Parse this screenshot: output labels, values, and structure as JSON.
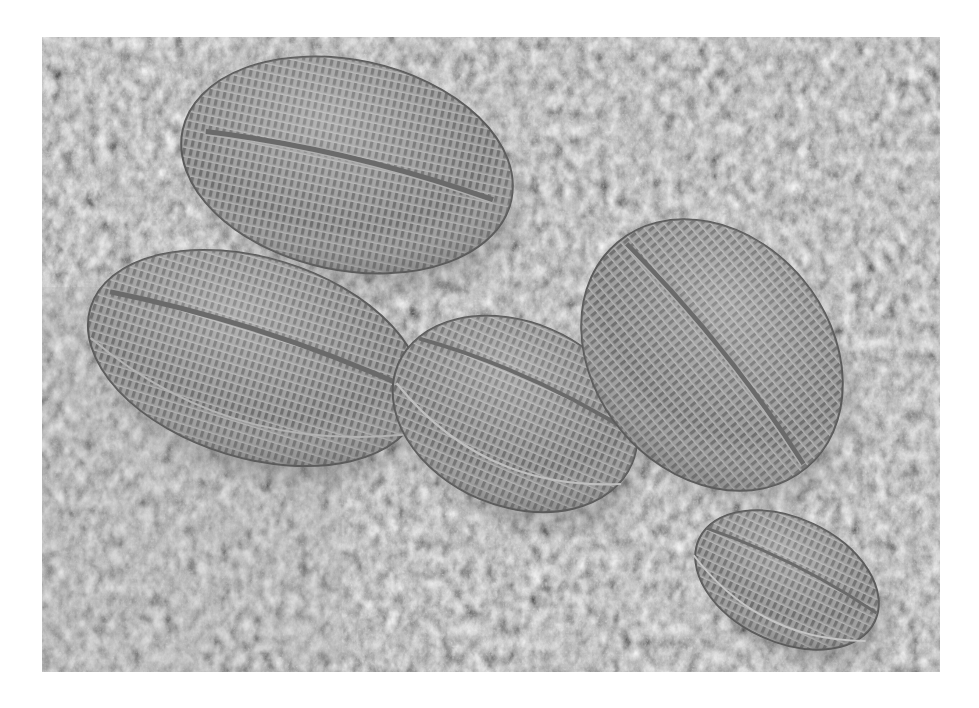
{
  "image": {
    "description": "Scanning electron micrograph of five oval diatom frustules resting on a fibrous substrate",
    "region": {
      "x": 42,
      "y": 37,
      "width": 898,
      "height": 635
    },
    "colors": {
      "page_bg": "#ffffff",
      "substrate": "#8a8a8a",
      "substrate_dark": "#4a4a4a",
      "frustule": "#9a9a9a",
      "frustule_light": "#c4c4c4"
    }
  },
  "diatoms": [
    {
      "id": "top-left",
      "cx": 305,
      "cy": 128,
      "rx": 168,
      "ry": 105,
      "rotate": 12
    },
    {
      "id": "left",
      "cx": 213,
      "cy": 321,
      "rx": 172,
      "ry": 100,
      "rotate": 17
    },
    {
      "id": "center",
      "cx": 473,
      "cy": 377,
      "rx": 127,
      "ry": 92,
      "rotate": 23
    },
    {
      "id": "right",
      "cx": 670,
      "cy": 318,
      "rx": 147,
      "ry": 118,
      "rotate": 50
    },
    {
      "id": "bottom-right",
      "cx": 745,
      "cy": 543,
      "rx": 97,
      "ry": 62,
      "rotate": 25
    }
  ]
}
